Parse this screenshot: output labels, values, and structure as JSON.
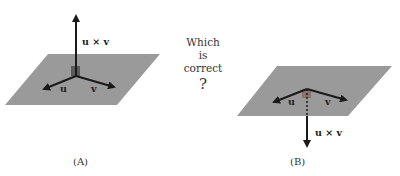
{
  "diagram": {
    "question": {
      "lines": [
        "Which",
        "is",
        "correct"
      ],
      "mark": "?"
    },
    "panels": [
      {
        "caption": "(A)",
        "vector_labels": {
          "u": "u",
          "v": "v",
          "cross": "u × v"
        },
        "cross_direction": "up"
      },
      {
        "caption": "(B)",
        "vector_labels": {
          "u": "u",
          "v": "v",
          "cross": "u × v"
        },
        "cross_direction": "down"
      }
    ],
    "colors": {
      "plane": "#9a9a9a",
      "arrow": "#1a1a1a",
      "corner": "#6a6a6a",
      "corner_b": "#8a7a7a"
    }
  }
}
